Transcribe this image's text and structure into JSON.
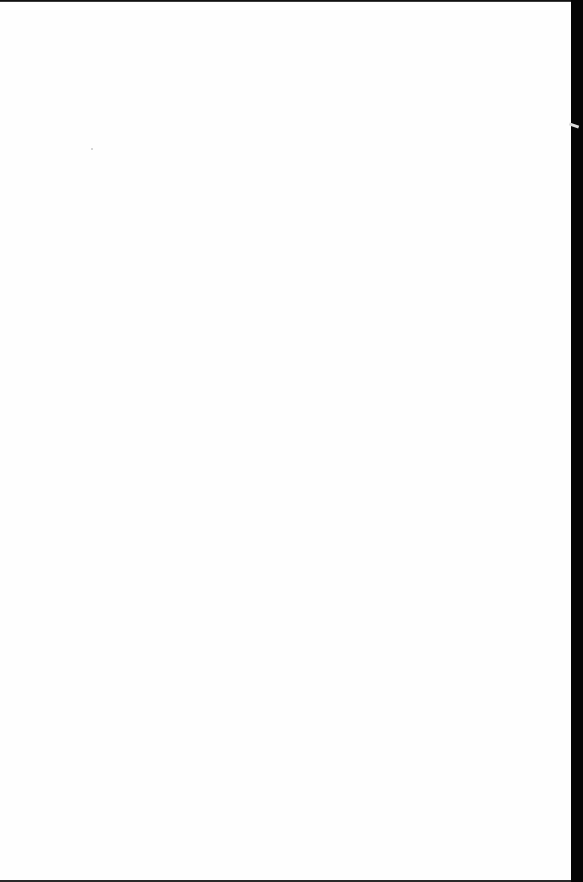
{
  "document": {
    "type": "scanned-page",
    "content": "",
    "colors": {
      "page": "#fefefe",
      "border": "#111111"
    }
  }
}
